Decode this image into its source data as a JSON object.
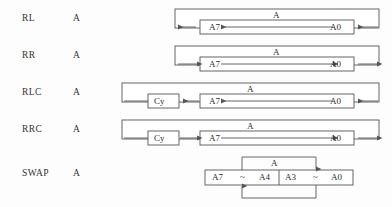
{
  "figure": {
    "title": "",
    "background_color": "#fdfdfd",
    "line_color": "#555555",
    "text_color": "#2b2b2b"
  },
  "rows": [
    {
      "mnemonic": "RL",
      "operand": "A",
      "outer_label": "A",
      "cy_label": "",
      "msb_label": "A7",
      "lsb_label": "A0",
      "direction": "left"
    },
    {
      "mnemonic": "RR",
      "operand": "A",
      "outer_label": "A",
      "cy_label": "",
      "msb_label": "A7",
      "lsb_label": "A0",
      "direction": "right"
    },
    {
      "mnemonic": "RLC",
      "operand": "A",
      "outer_label": "A",
      "cy_label": "Cy",
      "msb_label": "A7",
      "lsb_label": "A0",
      "direction": "left"
    },
    {
      "mnemonic": "RRC",
      "operand": "A",
      "outer_label": "A",
      "cy_label": "Cy",
      "msb_label": "A7",
      "lsb_label": "A0",
      "direction": "right"
    }
  ],
  "swap_row": {
    "mnemonic": "SWAP",
    "operand": "A",
    "outer_label": "A",
    "high_nibble": {
      "msb_label": "A7",
      "tilde": "~",
      "lsb_label": "A4"
    },
    "low_nibble": {
      "msb_label": "A3",
      "tilde": "~",
      "lsb_label": "A0"
    }
  }
}
